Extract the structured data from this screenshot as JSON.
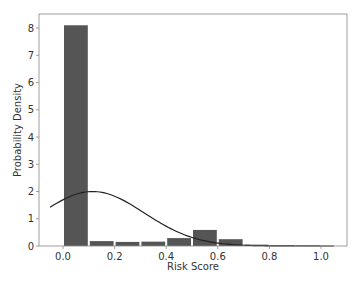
{
  "chart_data": {
    "type": "bar",
    "title": "",
    "xlabel": "Risk Score",
    "ylabel": "Probability Density",
    "xlim": [
      -0.09,
      1.1
    ],
    "ylim": [
      0,
      8.5
    ],
    "grid": false,
    "legend": null,
    "xticks": [
      0.0,
      0.2,
      0.4,
      0.6,
      0.8,
      1.0
    ],
    "xtick_labels": [
      "0.0",
      "0.2",
      "0.4",
      "0.6",
      "0.8",
      "1.0"
    ],
    "yticks": [
      0,
      1,
      2,
      3,
      4,
      5,
      6,
      7,
      8
    ],
    "ytick_labels": [
      "0",
      "1",
      "2",
      "3",
      "4",
      "5",
      "6",
      "7",
      "8"
    ],
    "histogram": {
      "bin_edges": [
        0.0,
        0.1,
        0.2,
        0.3,
        0.4,
        0.5,
        0.6,
        0.7,
        0.8,
        0.9,
        1.0
      ],
      "values": [
        8.1,
        0.18,
        0.15,
        0.16,
        0.29,
        0.59,
        0.25,
        0.05,
        0.02,
        0.02
      ],
      "color": "#555555"
    },
    "density_curve": {
      "type": "line",
      "label": "normal fit",
      "mean": 0.115,
      "std": 0.2,
      "x_range": [
        -0.05,
        1.05
      ],
      "peak": 2.0,
      "color": "#222222"
    }
  }
}
